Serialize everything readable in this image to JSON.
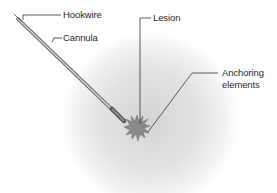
{
  "diagram": {
    "type": "medical-illustration",
    "labels": {
      "hookwire": "Hookwire",
      "cannula": "Cannula",
      "lesion": "Lesion",
      "anchoring_line1": "Anchoring",
      "anchoring_line2": "elements"
    },
    "colors": {
      "background": "#ffffff",
      "tissue_glow": "#d9d9d9",
      "lesion_fill": "#8c8c8c",
      "needle": "#7a7a7a",
      "leader_line": "#333333",
      "text": "#2a2a2a"
    }
  }
}
